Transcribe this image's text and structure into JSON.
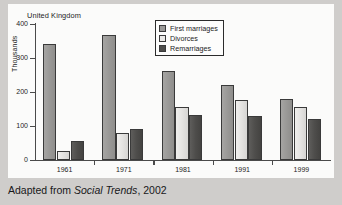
{
  "panel": {
    "title": "United Kingdom"
  },
  "caption": {
    "prefix": "Adapted from ",
    "source": "Social Trends",
    "suffix": ", 2002"
  },
  "legend": {
    "position": "top-center",
    "items": [
      {
        "label": "First marriages",
        "color": "#9b9a98",
        "icon": "legend-swatch-icon"
      },
      {
        "label": "Divorces",
        "color": "#ebeae8",
        "icon": "legend-swatch-icon"
      },
      {
        "label": "Remarriages",
        "color": "#4e4d4b",
        "icon": "legend-swatch-icon"
      }
    ]
  },
  "chart_data": {
    "type": "bar",
    "title": "United Kingdom",
    "xlabel": "",
    "ylabel": "Thousands",
    "ylim": [
      0,
      400
    ],
    "yticks": [
      0,
      100,
      200,
      300,
      400
    ],
    "ytick_labels": [
      "0",
      "100",
      "200",
      "300",
      "400"
    ],
    "grid": false,
    "legend_position": "top-center",
    "categories": [
      "1961",
      "1971",
      "1981",
      "1991",
      "1999"
    ],
    "series": [
      {
        "name": "First marriages",
        "color": "#9b9a98",
        "values": [
          340,
          369,
          262,
          220,
          180
        ]
      },
      {
        "name": "Divorces",
        "color": "#ebeae8",
        "values": [
          27,
          79,
          155,
          176,
          157
        ]
      },
      {
        "name": "Remarriages",
        "color": "#4e4d4b",
        "values": [
          57,
          90,
          133,
          128,
          120
        ]
      }
    ]
  }
}
